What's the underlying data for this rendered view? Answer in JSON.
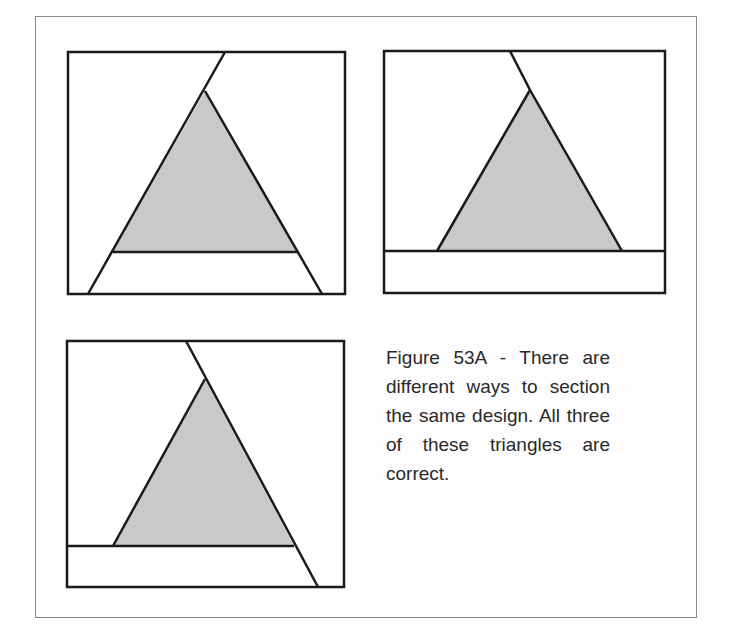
{
  "figure": {
    "id": "Figure 53A",
    "caption": "Figure 53A - There are different ways to section the same design. All three of these triangles are correct.",
    "colors": {
      "triangle_fill": "#c9c9c9",
      "stroke": "#1a1a1a",
      "frame": "#8a8a8a",
      "background": "#ffffff"
    }
  },
  "diagrams": [
    {
      "name": "diagram-1",
      "description": "Triangle with a diagonal from the top edge to the apex, a horizontal base line, and the sides extended to the bottom edge"
    },
    {
      "name": "diagram-2",
      "description": "Triangle with a diagonal from the top edge to the apex and a full-width bottom strip"
    },
    {
      "name": "diagram-3",
      "description": "Triangle with a diagonal from the top edge through the right side to the bottom edge, and a partial bottom strip"
    }
  ]
}
